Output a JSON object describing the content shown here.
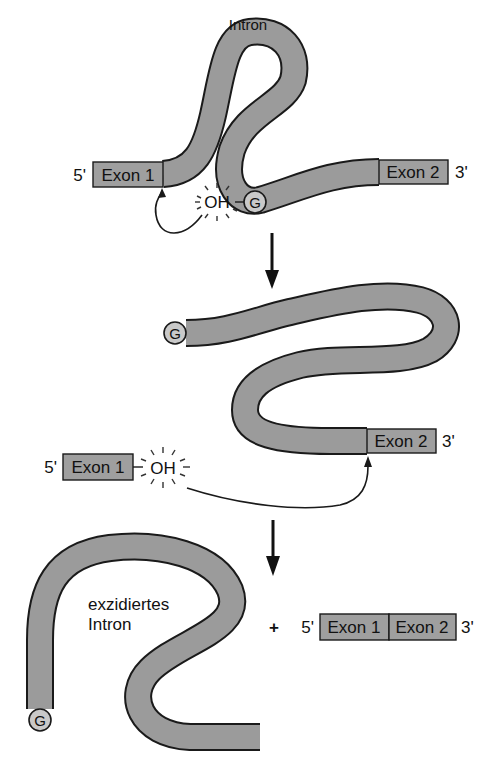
{
  "diagram": {
    "type": "splicing-mechanism",
    "step1": {
      "intron_label": "Intron",
      "five_prime": "5'",
      "three_prime": "3'",
      "exon1_label": "Exon 1",
      "exon2_label": "Exon 2",
      "oh_label": "OH",
      "g_label": "G"
    },
    "step2": {
      "g_label": "G",
      "five_prime": "5'",
      "three_prime": "3'",
      "exon1_label": "Exon 1",
      "exon2_label": "Exon 2",
      "oh_label": "OH"
    },
    "step3": {
      "excised_intron_line1": "exzidiertes",
      "excised_intron_line2": "Intron",
      "g_label": "G",
      "plus": "+",
      "five_prime": "5'",
      "three_prime": "3'",
      "exon1_label": "Exon 1",
      "exon2_label": "Exon 2"
    },
    "colors": {
      "tube_fill": "#9b9b9b",
      "outline": "#1a1a1a",
      "g_circle": "#c9c9c9"
    }
  }
}
